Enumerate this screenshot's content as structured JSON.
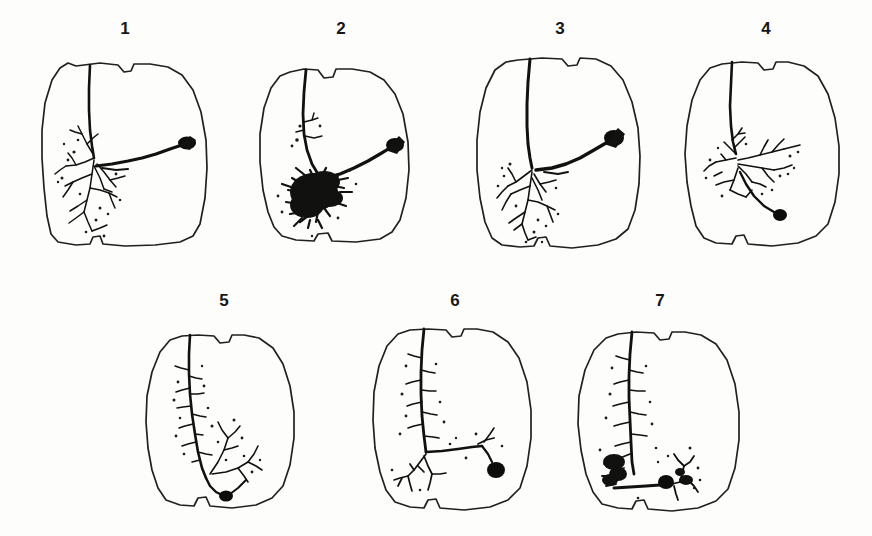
{
  "figure": {
    "type": "scientific-figure",
    "background_color": "#fdfdfc",
    "ink_color": "#111110",
    "outline_color": "#20201e",
    "rows": [
      {
        "panel_indices": [
          0,
          1,
          2,
          3
        ]
      },
      {
        "panel_indices": [
          4,
          5,
          6
        ]
      }
    ],
    "panels": [
      {
        "label": "1",
        "label_x": 105,
        "label_y": 30,
        "x": 30,
        "y": 55,
        "width": 190,
        "height": 200,
        "soma_position": "right-lateral",
        "arbor_density": "moderate-branched",
        "has_descending_axon": false
      },
      {
        "label": "2",
        "label_x": 313,
        "label_y": 30,
        "x": 252,
        "y": 58,
        "width": 175,
        "height": 195,
        "soma_position": "right-lateral",
        "arbor_density": "very-dense",
        "has_descending_axon": false
      },
      {
        "label": "3",
        "label_x": 533,
        "label_y": 30,
        "x": 470,
        "y": 50,
        "width": 180,
        "height": 205,
        "soma_position": "right-lateral",
        "arbor_density": "moderate-branched",
        "has_descending_axon": false
      },
      {
        "label": "4",
        "label_x": 740,
        "label_y": 30,
        "x": 678,
        "y": 52,
        "width": 175,
        "height": 200,
        "soma_position": "ventral-descending",
        "arbor_density": "moderate-spread",
        "has_descending_axon": true
      },
      {
        "label": "5",
        "label_x": 205,
        "label_y": 300,
        "x": 140,
        "y": 335,
        "width": 170,
        "height": 185,
        "soma_position": "ventral-midline",
        "arbor_density": "sparse-vertical",
        "has_descending_axon": true
      },
      {
        "label": "6",
        "label_x": 433,
        "label_y": 300,
        "x": 368,
        "y": 322,
        "width": 175,
        "height": 195,
        "soma_position": "ventral-lateral",
        "arbor_density": "sparse-vertical",
        "has_descending_axon": true
      },
      {
        "label": "7",
        "label_x": 640,
        "label_y": 300,
        "x": 570,
        "y": 325,
        "width": 180,
        "height": 192,
        "soma_position": "ventral-midline",
        "arbor_density": "moderate-vertical",
        "has_descending_axon": true
      }
    ]
  }
}
